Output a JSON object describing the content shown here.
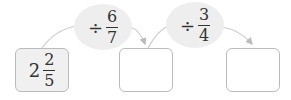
{
  "start": {
    "whole": "2",
    "numerator": "2",
    "denominator": "5"
  },
  "operations": [
    {
      "symbol": "÷",
      "numerator": "6",
      "denominator": "7"
    },
    {
      "symbol": "÷",
      "numerator": "3",
      "denominator": "4"
    }
  ],
  "answers": [
    "",
    ""
  ],
  "colors": {
    "box_border": "#bbbbbb",
    "oval_fill": "#eeeeee",
    "start_fill": "#f0f0f0",
    "arrow": "#c8c8c8"
  }
}
